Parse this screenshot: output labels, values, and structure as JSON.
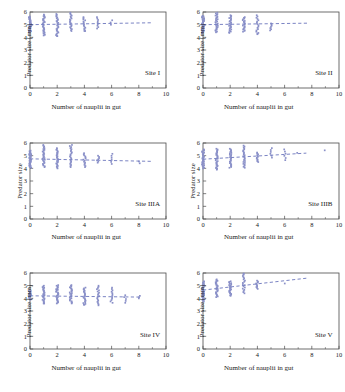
{
  "figure": {
    "xlabel": "Number of nauplii in gut",
    "ylabel_mm": "Predator size  [mm]",
    "ylabel_plain": "Predator size",
    "marker_color": "#8a90c8",
    "trend_color": "#7b84c4",
    "axis_color": "#4a4a4a"
  },
  "chart_data": [
    {
      "type": "scatter",
      "title": "Site I",
      "xlabel": "Number of nauplii in gut",
      "ylabel": "Predator size  [mm]",
      "xlim": [
        0,
        10
      ],
      "ylim": [
        0,
        6
      ],
      "xticks": [
        0,
        2,
        4,
        6,
        8,
        10
      ],
      "yticks": [
        0,
        1,
        2,
        3,
        4,
        5,
        6
      ],
      "xminorticks": [
        1,
        3,
        5,
        7,
        9
      ],
      "grid": false,
      "legend": "none",
      "trendline": {
        "x": [
          0,
          9
        ],
        "y": [
          5.0,
          5.15
        ],
        "style": "dashed"
      },
      "columns": [
        {
          "x": 0,
          "ymin": 4.45,
          "ymax": 5.65,
          "n": 30,
          "mean": 5.0
        },
        {
          "x": 1,
          "ymin": 4.2,
          "ymax": 5.8,
          "n": 28,
          "mean": 5.0,
          "outliers": [
            4.15
          ]
        },
        {
          "x": 2,
          "ymin": 4.1,
          "ymax": 5.85,
          "n": 26,
          "mean": 5.0,
          "outliers": [
            4.1
          ]
        },
        {
          "x": 3,
          "ymin": 4.5,
          "ymax": 5.95,
          "n": 20,
          "mean": 5.05
        },
        {
          "x": 4,
          "ymin": 4.5,
          "ymax": 5.6,
          "n": 14,
          "mean": 5.1,
          "outliers": [
            4.5
          ]
        },
        {
          "x": 5,
          "ymin": 4.7,
          "ymax": 5.6,
          "n": 9,
          "mean": 5.05
        },
        {
          "x": 6,
          "ymin": 5.0,
          "ymax": 5.35,
          "n": 3,
          "mean": 5.15
        }
      ]
    },
    {
      "type": "scatter",
      "title": "Site II",
      "xlabel": "Number of nauplii in gut",
      "ylabel": "Predator size  [mm]",
      "xlim": [
        0,
        10
      ],
      "ylim": [
        0,
        6
      ],
      "xticks": [
        0,
        2,
        4,
        6,
        8,
        10
      ],
      "yticks": [
        0,
        1,
        2,
        3,
        4,
        5,
        6
      ],
      "xminorticks": [
        1,
        3,
        5,
        7,
        9
      ],
      "grid": false,
      "legend": "none",
      "trendline": {
        "x": [
          0,
          7.8
        ],
        "y": [
          5.0,
          5.12
        ],
        "style": "dashed"
      },
      "columns": [
        {
          "x": 0,
          "ymin": 4.35,
          "ymax": 5.7,
          "n": 30,
          "mean": 5.0
        },
        {
          "x": 1,
          "ymin": 4.4,
          "ymax": 5.95,
          "n": 28,
          "mean": 5.0
        },
        {
          "x": 2,
          "ymin": 4.35,
          "ymax": 5.75,
          "n": 26,
          "mean": 5.0
        },
        {
          "x": 3,
          "ymin": 4.45,
          "ymax": 5.6,
          "n": 20,
          "mean": 5.05
        },
        {
          "x": 4,
          "ymin": 4.25,
          "ymax": 5.75,
          "n": 16,
          "mean": 5.05,
          "outliers": [
            4.3
          ]
        },
        {
          "x": 5,
          "ymin": 4.55,
          "ymax": 5.1,
          "n": 7,
          "mean": 4.85
        }
      ]
    },
    {
      "type": "scatter",
      "title": "Site IIIA",
      "xlabel": "Number of nauplii in gut",
      "ylabel": "Predator size",
      "xlim": [
        0,
        10
      ],
      "ylim": [
        0,
        6
      ],
      "xticks": [
        0,
        2,
        4,
        6,
        8,
        10
      ],
      "yticks": [
        0,
        1,
        2,
        3,
        4,
        5,
        6
      ],
      "xminorticks": [
        1,
        3,
        5,
        7,
        9
      ],
      "grid": false,
      "legend": "none",
      "trendline": {
        "x": [
          0,
          9
        ],
        "y": [
          4.75,
          4.55
        ],
        "style": "dashed"
      },
      "columns": [
        {
          "x": 0,
          "ymin": 4.05,
          "ymax": 5.4,
          "n": 30,
          "mean": 4.75
        },
        {
          "x": 1,
          "ymin": 4.1,
          "ymax": 5.85,
          "n": 28,
          "mean": 4.75
        },
        {
          "x": 2,
          "ymin": 4.0,
          "ymax": 5.6,
          "n": 26,
          "mean": 4.7
        },
        {
          "x": 3,
          "ymin": 4.1,
          "ymax": 5.85,
          "n": 22,
          "mean": 4.7
        },
        {
          "x": 4,
          "ymin": 4.1,
          "ymax": 5.2,
          "n": 14,
          "mean": 4.65
        },
        {
          "x": 5,
          "ymin": 4.45,
          "ymax": 5.0,
          "n": 7,
          "mean": 4.7
        },
        {
          "x": 6,
          "ymin": 4.35,
          "ymax": 5.15,
          "n": 6,
          "mean": 4.6
        },
        {
          "x": 8,
          "ymin": 4.4,
          "ymax": 4.55,
          "n": 2,
          "mean": 4.5
        }
      ]
    },
    {
      "type": "scatter",
      "title": "Site IIIB",
      "xlabel": "Number of nauplii in gut",
      "ylabel": "Predator size",
      "xlim": [
        0,
        10
      ],
      "ylim": [
        0,
        6
      ],
      "xticks": [
        0,
        2,
        4,
        6,
        8,
        10
      ],
      "yticks": [
        0,
        1,
        2,
        3,
        4,
        5,
        6
      ],
      "xminorticks": [
        1,
        3,
        5,
        7,
        9
      ],
      "grid": false,
      "legend": "none",
      "trendline": {
        "x": [
          0,
          7.6
        ],
        "y": [
          4.72,
          5.2
        ],
        "style": "dashed"
      },
      "columns": [
        {
          "x": 0,
          "ymin": 4.0,
          "ymax": 5.5,
          "n": 30,
          "mean": 4.7
        },
        {
          "x": 1,
          "ymin": 3.9,
          "ymax": 5.55,
          "n": 28,
          "mean": 4.7
        },
        {
          "x": 2,
          "ymin": 4.05,
          "ymax": 5.55,
          "n": 26,
          "mean": 4.8
        },
        {
          "x": 3,
          "ymin": 4.05,
          "ymax": 5.8,
          "n": 24,
          "mean": 4.85
        },
        {
          "x": 4,
          "ymin": 4.5,
          "ymax": 5.25,
          "n": 12,
          "mean": 4.9
        },
        {
          "x": 5,
          "ymin": 4.85,
          "ymax": 5.6,
          "n": 6,
          "mean": 5.15
        },
        {
          "x": 6,
          "ymin": 4.65,
          "ymax": 5.5,
          "n": 6,
          "mean": 5.1
        },
        {
          "x": 7,
          "ymin": 5.2,
          "ymax": 5.25,
          "n": 1,
          "mean": 5.2
        },
        {
          "x": 9,
          "ymin": 5.4,
          "ymax": 5.45,
          "n": 1,
          "mean": 5.4
        }
      ]
    },
    {
      "type": "scatter",
      "title": "Site IV",
      "xlabel": "Number of nauplii in gut",
      "ylabel": "Predator size  [mm]",
      "xlim": [
        0,
        10
      ],
      "ylim": [
        0,
        6
      ],
      "xticks": [
        0,
        2,
        4,
        6,
        8,
        10
      ],
      "yticks": [
        0,
        1,
        2,
        3,
        4,
        5,
        6
      ],
      "xminorticks": [
        1,
        3,
        5,
        7,
        9
      ],
      "grid": false,
      "legend": "none",
      "trendline": {
        "x": [
          0,
          8
        ],
        "y": [
          4.2,
          4.1
        ],
        "style": "dashed"
      },
      "columns": [
        {
          "x": 0,
          "ymin": 3.9,
          "ymax": 4.6,
          "n": 20,
          "mean": 4.2
        },
        {
          "x": 1,
          "ymin": 3.6,
          "ymax": 5.0,
          "n": 26,
          "mean": 4.25,
          "outliers": [
            3.6
          ]
        },
        {
          "x": 2,
          "ymin": 3.6,
          "ymax": 5.05,
          "n": 28,
          "mean": 4.2
        },
        {
          "x": 3,
          "ymin": 3.6,
          "ymax": 5.05,
          "n": 26,
          "mean": 4.2
        },
        {
          "x": 4,
          "ymin": 3.5,
          "ymax": 4.85,
          "n": 22,
          "mean": 4.15,
          "outliers": [
            3.5
          ]
        },
        {
          "x": 5,
          "ymin": 3.45,
          "ymax": 5.0,
          "n": 18,
          "mean": 4.15
        },
        {
          "x": 6,
          "ymin": 3.65,
          "ymax": 4.85,
          "n": 12,
          "mean": 4.15
        },
        {
          "x": 7,
          "ymin": 3.65,
          "ymax": 4.25,
          "n": 5,
          "mean": 4.0
        },
        {
          "x": 8,
          "ymin": 4.0,
          "ymax": 4.2,
          "n": 3,
          "mean": 4.1
        }
      ]
    },
    {
      "type": "scatter",
      "title": "Site V",
      "xlabel": "Number of nauplii in gut",
      "ylabel": "Predator size  [mm]",
      "xlim": [
        0,
        10
      ],
      "ylim": [
        0,
        6
      ],
      "xticks": [
        0,
        2,
        4,
        6,
        8,
        10
      ],
      "yticks": [
        0,
        1,
        2,
        3,
        4,
        5,
        6
      ],
      "xminorticks": [
        1,
        3,
        5,
        7,
        9
      ],
      "grid": false,
      "legend": "none",
      "trendline": {
        "x": [
          0,
          7.7
        ],
        "y": [
          4.65,
          5.6
        ],
        "style": "dashed"
      },
      "columns": [
        {
          "x": 0,
          "ymin": 3.75,
          "ymax": 5.35,
          "n": 30,
          "mean": 4.6
        },
        {
          "x": 1,
          "ymin": 4.1,
          "ymax": 5.5,
          "n": 26,
          "mean": 4.7
        },
        {
          "x": 2,
          "ymin": 4.2,
          "ymax": 5.35,
          "n": 24,
          "mean": 4.8
        },
        {
          "x": 3,
          "ymin": 4.4,
          "ymax": 5.95,
          "n": 18,
          "mean": 4.95,
          "outliers": [
            5.95
          ]
        },
        {
          "x": 4,
          "ymin": 4.75,
          "ymax": 5.4,
          "n": 10,
          "mean": 5.15
        },
        {
          "x": 6,
          "ymin": 5.15,
          "ymax": 5.2,
          "n": 1,
          "mean": 5.15
        }
      ]
    }
  ]
}
